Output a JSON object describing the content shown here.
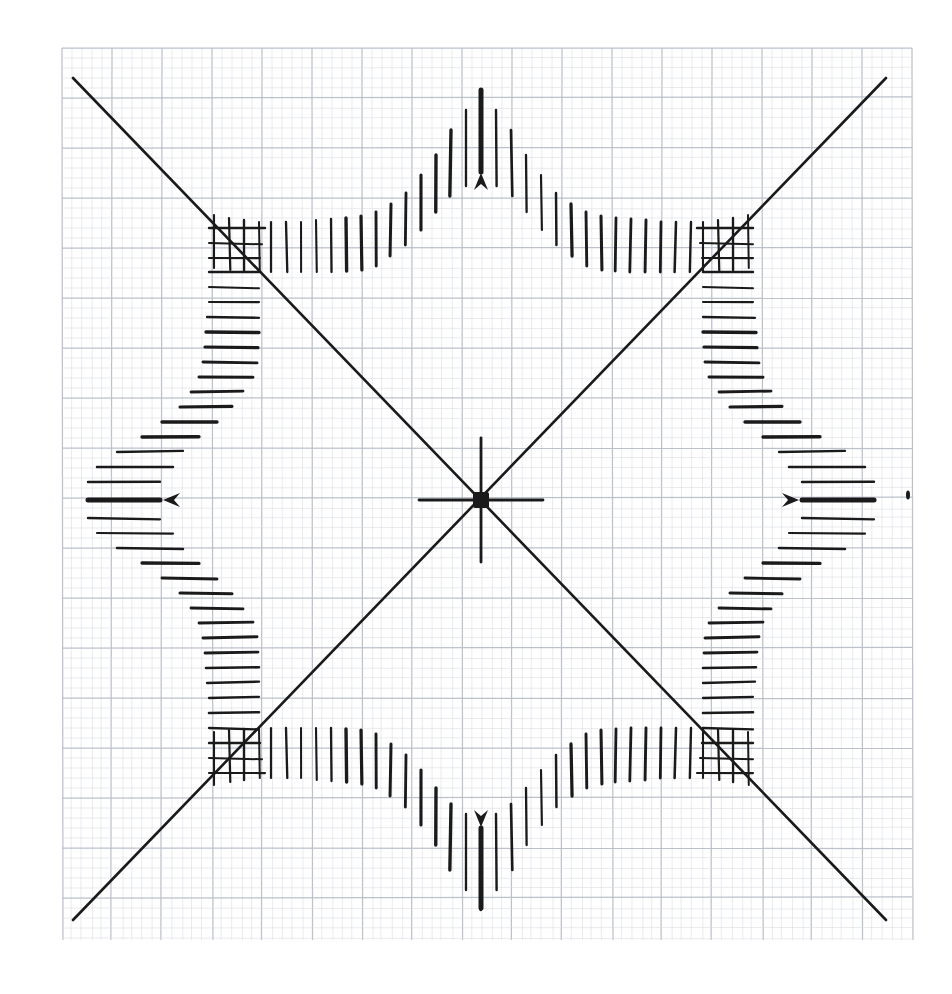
{
  "document": {
    "kind": "hand-drawn-technical-diagram",
    "medium": "graph paper scan",
    "title": "Four-lobed tick-mark rosette plot on millimetre graph paper",
    "background_color": "#ffffff",
    "ink_color": "#1a1a1a"
  },
  "grid": {
    "name": "millimetre-graph-paper",
    "fine_spacing_px": 10,
    "bold_spacing_px": 50,
    "fine_color": "#d6d9e0",
    "bold_color": "#b9bec8",
    "left": 62,
    "top": 48,
    "right": 912,
    "bottom": 940
  },
  "origin": {
    "label": "plot-origin",
    "x": 481,
    "y": 500,
    "marker": "filled-square-with-crosshair",
    "square_size_px": 16,
    "crosshair_horizontal_half_len": 62,
    "crosshair_vertical_half_len": 62
  },
  "diagonals": [
    {
      "name": "diagonal-nw-se",
      "x1": 73,
      "y1": 78,
      "x2": 886,
      "y2": 920,
      "stroke_width": 2.6
    },
    {
      "name": "diagonal-sw-ne",
      "x1": 73,
      "y1": 920,
      "x2": 886,
      "y2": 78,
      "stroke_width": 2.6
    }
  ],
  "axis_markers": [
    {
      "name": "marker-north",
      "direction": "up",
      "tip_x": 481,
      "tip_y": 173,
      "bold_line_from_y": 90,
      "bold_line_to_y": 172,
      "stroke_width": 5
    },
    {
      "name": "marker-south",
      "direction": "down",
      "tip_x": 481,
      "tip_y": 827,
      "bold_line_from_y": 828,
      "bold_line_to_y": 908,
      "stroke_width": 5
    },
    {
      "name": "marker-west",
      "direction": "left",
      "tip_x": 163,
      "tip_y": 500,
      "bold_line_from_x": 88,
      "bold_line_to_x": 160,
      "stroke_width": 5
    },
    {
      "name": "marker-east",
      "direction": "right",
      "tip_x": 799,
      "tip_y": 500,
      "bold_line_from_x": 802,
      "bold_line_to_x": 874,
      "stroke_width": 5
    }
  ],
  "stray_mark": {
    "name": "ink-speck",
    "x": 908,
    "y": 495,
    "w": 4,
    "h": 9
  },
  "chart_data": {
    "type": "scatter",
    "xlabel": "",
    "ylabel": "",
    "grid": true,
    "legend": null,
    "xlim": [
      62,
      912
    ],
    "ylim": [
      48,
      940
    ],
    "annotations": [
      "centre origin mark: filled square with small crosshair",
      "four bold arrowheads on the cardinal axes (up, down, left, right)",
      "stray ink speck near right edge"
    ],
    "series": [
      {
        "name": "north-lobe-vertical-ticks",
        "orientation": "vertical",
        "note": "x = tick x-position, y_top and y_bottom are the tick endpoints in image pixels",
        "ticks": [
          {
            "x": 271,
            "y_top": 222,
            "y_bottom": 272
          },
          {
            "x": 286,
            "y_top": 222,
            "y_bottom": 272
          },
          {
            "x": 301,
            "y_top": 222,
            "y_bottom": 272
          },
          {
            "x": 316,
            "y_top": 220,
            "y_bottom": 272
          },
          {
            "x": 331,
            "y_top": 219,
            "y_bottom": 272
          },
          {
            "x": 346,
            "y_top": 218,
            "y_bottom": 271
          },
          {
            "x": 361,
            "y_top": 216,
            "y_bottom": 270
          },
          {
            "x": 376,
            "y_top": 212,
            "y_bottom": 266
          },
          {
            "x": 391,
            "y_top": 204,
            "y_bottom": 256
          },
          {
            "x": 406,
            "y_top": 193,
            "y_bottom": 245
          },
          {
            "x": 421,
            "y_top": 175,
            "y_bottom": 230
          },
          {
            "x": 436,
            "y_top": 155,
            "y_bottom": 212
          },
          {
            "x": 451,
            "y_top": 130,
            "y_bottom": 196
          },
          {
            "x": 466,
            "y_top": 110,
            "y_bottom": 186
          },
          {
            "x": 481,
            "y_top": 90,
            "y_bottom": 172
          },
          {
            "x": 496,
            "y_top": 110,
            "y_bottom": 186
          },
          {
            "x": 511,
            "y_top": 130,
            "y_bottom": 196
          },
          {
            "x": 526,
            "y_top": 155,
            "y_bottom": 212
          },
          {
            "x": 541,
            "y_top": 175,
            "y_bottom": 230
          },
          {
            "x": 556,
            "y_top": 193,
            "y_bottom": 245
          },
          {
            "x": 571,
            "y_top": 204,
            "y_bottom": 256
          },
          {
            "x": 586,
            "y_top": 212,
            "y_bottom": 266
          },
          {
            "x": 601,
            "y_top": 216,
            "y_bottom": 270
          },
          {
            "x": 616,
            "y_top": 218,
            "y_bottom": 271
          },
          {
            "x": 631,
            "y_top": 219,
            "y_bottom": 272
          },
          {
            "x": 646,
            "y_top": 220,
            "y_bottom": 272
          },
          {
            "x": 661,
            "y_top": 222,
            "y_bottom": 272
          },
          {
            "x": 676,
            "y_top": 222,
            "y_bottom": 272
          },
          {
            "x": 691,
            "y_top": 222,
            "y_bottom": 272
          }
        ]
      },
      {
        "name": "south-lobe-vertical-ticks",
        "orientation": "vertical",
        "ticks": [
          {
            "x": 271,
            "y_top": 728,
            "y_bottom": 778
          },
          {
            "x": 286,
            "y_top": 728,
            "y_bottom": 778
          },
          {
            "x": 301,
            "y_top": 728,
            "y_bottom": 778
          },
          {
            "x": 316,
            "y_top": 728,
            "y_bottom": 780
          },
          {
            "x": 331,
            "y_top": 728,
            "y_bottom": 781
          },
          {
            "x": 346,
            "y_top": 729,
            "y_bottom": 782
          },
          {
            "x": 361,
            "y_top": 730,
            "y_bottom": 784
          },
          {
            "x": 376,
            "y_top": 734,
            "y_bottom": 788
          },
          {
            "x": 391,
            "y_top": 744,
            "y_bottom": 796
          },
          {
            "x": 406,
            "y_top": 755,
            "y_bottom": 807
          },
          {
            "x": 421,
            "y_top": 770,
            "y_bottom": 825
          },
          {
            "x": 436,
            "y_top": 788,
            "y_bottom": 845
          },
          {
            "x": 451,
            "y_top": 804,
            "y_bottom": 870
          },
          {
            "x": 466,
            "y_top": 814,
            "y_bottom": 890
          },
          {
            "x": 481,
            "y_top": 828,
            "y_bottom": 910
          },
          {
            "x": 496,
            "y_top": 814,
            "y_bottom": 890
          },
          {
            "x": 511,
            "y_top": 804,
            "y_bottom": 870
          },
          {
            "x": 526,
            "y_top": 788,
            "y_bottom": 845
          },
          {
            "x": 541,
            "y_top": 770,
            "y_bottom": 825
          },
          {
            "x": 556,
            "y_top": 755,
            "y_bottom": 807
          },
          {
            "x": 571,
            "y_top": 744,
            "y_bottom": 796
          },
          {
            "x": 586,
            "y_top": 734,
            "y_bottom": 788
          },
          {
            "x": 601,
            "y_top": 730,
            "y_bottom": 784
          },
          {
            "x": 616,
            "y_top": 729,
            "y_bottom": 782
          },
          {
            "x": 631,
            "y_top": 728,
            "y_bottom": 781
          },
          {
            "x": 646,
            "y_top": 728,
            "y_bottom": 780
          },
          {
            "x": 661,
            "y_top": 728,
            "y_bottom": 778
          },
          {
            "x": 676,
            "y_top": 728,
            "y_bottom": 778
          },
          {
            "x": 691,
            "y_top": 728,
            "y_bottom": 778
          }
        ]
      },
      {
        "name": "west-lobe-horizontal-ticks",
        "orientation": "horizontal",
        "note": "y = tick y-position, x_left and x_right are the tick endpoints in image pixels",
        "ticks": [
          {
            "y": 272,
            "x_left": 209,
            "x_right": 259
          },
          {
            "y": 287,
            "x_left": 209,
            "x_right": 259
          },
          {
            "y": 302,
            "x_left": 209,
            "x_right": 259
          },
          {
            "y": 317,
            "x_left": 207,
            "x_right": 259
          },
          {
            "y": 332,
            "x_left": 206,
            "x_right": 259
          },
          {
            "y": 347,
            "x_left": 205,
            "x_right": 258
          },
          {
            "y": 362,
            "x_left": 203,
            "x_right": 257
          },
          {
            "y": 377,
            "x_left": 199,
            "x_right": 253
          },
          {
            "y": 392,
            "x_left": 191,
            "x_right": 243
          },
          {
            "y": 407,
            "x_left": 180,
            "x_right": 232
          },
          {
            "y": 422,
            "x_left": 162,
            "x_right": 217
          },
          {
            "y": 437,
            "x_left": 142,
            "x_right": 199
          },
          {
            "y": 452,
            "x_left": 117,
            "x_right": 183
          },
          {
            "y": 467,
            "x_left": 97,
            "x_right": 173
          },
          {
            "y": 482,
            "x_left": 88,
            "x_right": 160
          },
          {
            "y": 500,
            "x_left": 88,
            "x_right": 160
          },
          {
            "y": 518,
            "x_left": 88,
            "x_right": 160
          },
          {
            "y": 533,
            "x_left": 97,
            "x_right": 173
          },
          {
            "y": 548,
            "x_left": 117,
            "x_right": 183
          },
          {
            "y": 563,
            "x_left": 142,
            "x_right": 199
          },
          {
            "y": 578,
            "x_left": 162,
            "x_right": 217
          },
          {
            "y": 593,
            "x_left": 180,
            "x_right": 232
          },
          {
            "y": 608,
            "x_left": 191,
            "x_right": 243
          },
          {
            "y": 623,
            "x_left": 199,
            "x_right": 253
          },
          {
            "y": 638,
            "x_left": 203,
            "x_right": 257
          },
          {
            "y": 653,
            "x_left": 205,
            "x_right": 258
          },
          {
            "y": 668,
            "x_left": 206,
            "x_right": 259
          },
          {
            "y": 683,
            "x_left": 207,
            "x_right": 259
          },
          {
            "y": 698,
            "x_left": 209,
            "x_right": 259
          },
          {
            "y": 713,
            "x_left": 209,
            "x_right": 259
          },
          {
            "y": 728,
            "x_left": 209,
            "x_right": 259
          }
        ]
      },
      {
        "name": "east-lobe-horizontal-ticks",
        "orientation": "horizontal",
        "ticks": [
          {
            "y": 272,
            "x_left": 703,
            "x_right": 753
          },
          {
            "y": 287,
            "x_left": 703,
            "x_right": 753
          },
          {
            "y": 302,
            "x_left": 703,
            "x_right": 753
          },
          {
            "y": 317,
            "x_left": 703,
            "x_right": 755
          },
          {
            "y": 332,
            "x_left": 703,
            "x_right": 756
          },
          {
            "y": 347,
            "x_left": 704,
            "x_right": 757
          },
          {
            "y": 362,
            "x_left": 705,
            "x_right": 759
          },
          {
            "y": 377,
            "x_left": 709,
            "x_right": 763
          },
          {
            "y": 392,
            "x_left": 719,
            "x_right": 771
          },
          {
            "y": 407,
            "x_left": 730,
            "x_right": 782
          },
          {
            "y": 422,
            "x_left": 745,
            "x_right": 800
          },
          {
            "y": 437,
            "x_left": 763,
            "x_right": 820
          },
          {
            "y": 452,
            "x_left": 779,
            "x_right": 845
          },
          {
            "y": 467,
            "x_left": 789,
            "x_right": 865
          },
          {
            "y": 482,
            "x_left": 802,
            "x_right": 874
          },
          {
            "y": 500,
            "x_left": 802,
            "x_right": 874
          },
          {
            "y": 518,
            "x_left": 802,
            "x_right": 874
          },
          {
            "y": 533,
            "x_left": 789,
            "x_right": 865
          },
          {
            "y": 548,
            "x_left": 779,
            "x_right": 845
          },
          {
            "y": 563,
            "x_left": 763,
            "x_right": 820
          },
          {
            "y": 578,
            "x_left": 745,
            "x_right": 800
          },
          {
            "y": 593,
            "x_left": 730,
            "x_right": 782
          },
          {
            "y": 608,
            "x_left": 719,
            "x_right": 771
          },
          {
            "y": 623,
            "x_left": 709,
            "x_right": 763
          },
          {
            "y": 638,
            "x_left": 705,
            "x_right": 759
          },
          {
            "y": 653,
            "x_left": 704,
            "x_right": 757
          },
          {
            "y": 668,
            "x_left": 703,
            "x_right": 756
          },
          {
            "y": 683,
            "x_left": 703,
            "x_right": 755
          },
          {
            "y": 698,
            "x_left": 703,
            "x_right": 753
          },
          {
            "y": 713,
            "x_left": 703,
            "x_right": 753
          },
          {
            "y": 728,
            "x_left": 703,
            "x_right": 753
          }
        ]
      },
      {
        "name": "nw-corner-horizontal-ticks",
        "orientation": "horizontal",
        "ticks": [
          {
            "y": 228,
            "x_left": 209,
            "x_right": 265
          },
          {
            "y": 243,
            "x_left": 209,
            "x_right": 262
          },
          {
            "y": 258,
            "x_left": 209,
            "x_right": 260
          }
        ]
      },
      {
        "name": "ne-corner-horizontal-ticks",
        "orientation": "horizontal",
        "ticks": [
          {
            "y": 228,
            "x_left": 697,
            "x_right": 753
          },
          {
            "y": 243,
            "x_left": 700,
            "x_right": 753
          },
          {
            "y": 258,
            "x_left": 702,
            "x_right": 753
          }
        ]
      },
      {
        "name": "sw-corner-horizontal-ticks",
        "orientation": "horizontal",
        "ticks": [
          {
            "y": 743,
            "x_left": 209,
            "x_right": 260
          },
          {
            "y": 758,
            "x_left": 209,
            "x_right": 262
          },
          {
            "y": 773,
            "x_left": 209,
            "x_right": 265
          }
        ]
      },
      {
        "name": "se-corner-horizontal-ticks",
        "orientation": "horizontal",
        "ticks": [
          {
            "y": 743,
            "x_left": 702,
            "x_right": 753
          },
          {
            "y": 758,
            "x_left": 700,
            "x_right": 753
          },
          {
            "y": 773,
            "x_left": 697,
            "x_right": 753
          }
        ]
      },
      {
        "name": "nw-corner-vertical-ticks",
        "orientation": "vertical",
        "ticks": [
          {
            "x": 214,
            "y_top": 215,
            "y_bottom": 268
          },
          {
            "x": 229,
            "y_top": 218,
            "y_bottom": 270
          },
          {
            "x": 244,
            "y_top": 220,
            "y_bottom": 271
          },
          {
            "x": 259,
            "y_top": 222,
            "y_bottom": 272
          }
        ]
      },
      {
        "name": "ne-corner-vertical-ticks",
        "orientation": "vertical",
        "ticks": [
          {
            "x": 703,
            "y_top": 222,
            "y_bottom": 272
          },
          {
            "x": 718,
            "y_top": 220,
            "y_bottom": 271
          },
          {
            "x": 733,
            "y_top": 218,
            "y_bottom": 270
          },
          {
            "x": 748,
            "y_top": 215,
            "y_bottom": 268
          }
        ]
      },
      {
        "name": "sw-corner-vertical-ticks",
        "orientation": "vertical",
        "ticks": [
          {
            "x": 214,
            "y_top": 732,
            "y_bottom": 785
          },
          {
            "x": 229,
            "y_top": 730,
            "y_bottom": 782
          },
          {
            "x": 244,
            "y_top": 729,
            "y_bottom": 780
          },
          {
            "x": 259,
            "y_top": 728,
            "y_bottom": 778
          }
        ]
      },
      {
        "name": "se-corner-vertical-ticks",
        "orientation": "vertical",
        "ticks": [
          {
            "x": 703,
            "y_top": 728,
            "y_bottom": 778
          },
          {
            "x": 718,
            "y_top": 729,
            "y_bottom": 780
          },
          {
            "x": 733,
            "y_top": 730,
            "y_bottom": 782
          },
          {
            "x": 748,
            "y_top": 732,
            "y_bottom": 785
          }
        ]
      }
    ]
  }
}
